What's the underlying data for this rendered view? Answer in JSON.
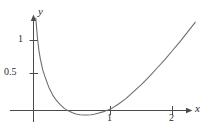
{
  "figure": {
    "axis_labels": {
      "x": "x",
      "y": "y"
    },
    "colors": {
      "axis": "#4a4a4a",
      "curve": "#6e6e6e",
      "text": "#2b2b2b",
      "background": "#ffffff"
    }
  },
  "chart_data": {
    "type": "line",
    "title": "",
    "xlabel": "x",
    "ylabel": "y",
    "xlim": [
      -0.1,
      2.35
    ],
    "ylim": [
      -0.22,
      1.35
    ],
    "grid": false,
    "legend": null,
    "x_ticks": [
      {
        "value": 1,
        "label": "1"
      },
      {
        "value": 2,
        "label": "2"
      }
    ],
    "y_ticks": [
      {
        "value": 0.5,
        "label": "0.5"
      },
      {
        "value": 1,
        "label": "1"
      }
    ],
    "series": [
      {
        "name": "curve",
        "x": [
          0.03,
          0.05,
          0.07,
          0.09,
          0.12,
          0.15,
          0.2,
          0.25,
          0.3,
          0.35,
          0.4,
          0.45,
          0.5,
          0.55,
          0.6,
          0.65,
          0.7,
          0.75,
          0.8,
          0.85,
          0.9,
          0.95,
          1.0,
          1.1,
          1.2,
          1.3,
          1.4,
          1.5,
          1.6,
          1.7,
          1.8,
          1.9,
          2.0,
          2.1
        ],
        "y": [
          1.32,
          1.05,
          0.86,
          0.73,
          0.58,
          0.48,
          0.33,
          0.22,
          0.14,
          0.08,
          0.03,
          -0.005,
          -0.03,
          -0.05,
          -0.06,
          -0.065,
          -0.065,
          -0.06,
          -0.05,
          -0.035,
          -0.02,
          0.0,
          0.02,
          0.09,
          0.17,
          0.27,
          0.37,
          0.48,
          0.6,
          0.72,
          0.85,
          0.98,
          1.12,
          1.26
        ]
      }
    ]
  }
}
